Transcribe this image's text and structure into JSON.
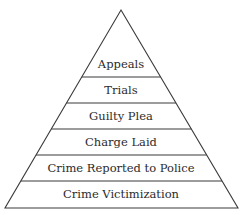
{
  "diagram": {
    "type": "pyramid",
    "line_color": "#3a3a3a",
    "text_color": "#2b2b2b",
    "apex": {
      "x": 121,
      "y": 10
    },
    "base": {
      "left_x": 5,
      "right_x": 238,
      "y": 208
    },
    "tiers": [
      {
        "label": "Appeals",
        "top_y": 10,
        "bottom_y": 77,
        "label_y": 68
      },
      {
        "label": "Trials",
        "top_y": 77,
        "bottom_y": 103,
        "label_y": 94
      },
      {
        "label": "Guilty Plea",
        "top_y": 103,
        "bottom_y": 129,
        "label_y": 120
      },
      {
        "label": "Charge Laid",
        "top_y": 129,
        "bottom_y": 155,
        "label_y": 146
      },
      {
        "label": "Crime Reported to Police",
        "top_y": 155,
        "bottom_y": 181,
        "label_y": 172
      },
      {
        "label": "Crime Victimization",
        "top_y": 181,
        "bottom_y": 208,
        "label_y": 198
      }
    ]
  }
}
